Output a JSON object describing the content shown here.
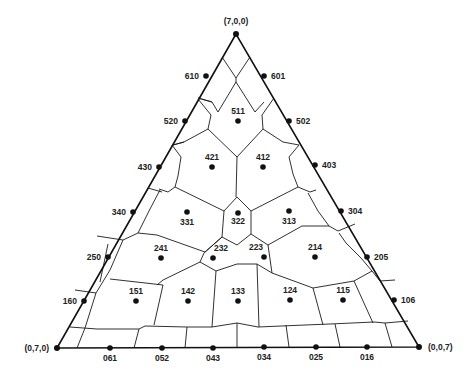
{
  "diagram": {
    "type": "ternary-voronoi",
    "corners": [
      {
        "id": "top",
        "label": "(7,0,0)",
        "x": 236,
        "y": 34,
        "lx": 236,
        "ly": 24,
        "anchor": "middle"
      },
      {
        "id": "left",
        "label": "(0,7,0)",
        "x": 57,
        "y": 348,
        "lx": 49,
        "ly": 351,
        "anchor": "end"
      },
      {
        "id": "right",
        "label": "(0,0,7)",
        "x": 419,
        "y": 347,
        "lx": 428,
        "ly": 350,
        "anchor": "start"
      }
    ],
    "points": [
      {
        "label": "610",
        "x": 206,
        "y": 76,
        "lx": 199,
        "ly": 79,
        "anchor": "end"
      },
      {
        "label": "601",
        "x": 264,
        "y": 76,
        "lx": 271,
        "ly": 79,
        "anchor": "start"
      },
      {
        "label": "520",
        "x": 185,
        "y": 121,
        "lx": 178,
        "ly": 124,
        "anchor": "end"
      },
      {
        "label": "511",
        "x": 238,
        "y": 121,
        "lx": 238,
        "ly": 114,
        "anchor": "middle"
      },
      {
        "label": "502",
        "x": 289,
        "y": 121,
        "lx": 296,
        "ly": 124,
        "anchor": "start"
      },
      {
        "label": "430",
        "x": 159,
        "y": 167,
        "lx": 152,
        "ly": 170,
        "anchor": "end"
      },
      {
        "label": "421",
        "x": 212,
        "y": 167,
        "lx": 212,
        "ly": 160,
        "anchor": "middle"
      },
      {
        "label": "412",
        "x": 263,
        "y": 167,
        "lx": 263,
        "ly": 160,
        "anchor": "middle"
      },
      {
        "label": "403",
        "x": 315,
        "y": 165,
        "lx": 322,
        "ly": 168,
        "anchor": "start"
      },
      {
        "label": "340",
        "x": 133,
        "y": 212,
        "lx": 126,
        "ly": 215,
        "anchor": "end"
      },
      {
        "label": "331",
        "x": 187,
        "y": 212,
        "lx": 187,
        "ly": 225,
        "anchor": "middle"
      },
      {
        "label": "322",
        "x": 238,
        "y": 213,
        "lx": 238,
        "ly": 224,
        "anchor": "middle"
      },
      {
        "label": "313",
        "x": 289,
        "y": 211,
        "lx": 289,
        "ly": 224,
        "anchor": "middle"
      },
      {
        "label": "304",
        "x": 341,
        "y": 211,
        "lx": 348,
        "ly": 214,
        "anchor": "start"
      },
      {
        "label": "250",
        "x": 108,
        "y": 257,
        "lx": 101,
        "ly": 260,
        "anchor": "end"
      },
      {
        "label": "241",
        "x": 161,
        "y": 258,
        "lx": 161,
        "ly": 251,
        "anchor": "middle"
      },
      {
        "label": "232",
        "x": 213,
        "y": 258,
        "lx": 221,
        "ly": 251,
        "anchor": "middle"
      },
      {
        "label": "223",
        "x": 264,
        "y": 257,
        "lx": 256,
        "ly": 250,
        "anchor": "middle"
      },
      {
        "label": "214",
        "x": 315,
        "y": 257,
        "lx": 315,
        "ly": 250,
        "anchor": "middle"
      },
      {
        "label": "205",
        "x": 367,
        "y": 257,
        "lx": 374,
        "ly": 260,
        "anchor": "start"
      },
      {
        "label": "160",
        "x": 84,
        "y": 301,
        "lx": 77,
        "ly": 304,
        "anchor": "end"
      },
      {
        "label": "151",
        "x": 136,
        "y": 301,
        "lx": 136,
        "ly": 294,
        "anchor": "middle"
      },
      {
        "label": "142",
        "x": 188,
        "y": 301,
        "lx": 188,
        "ly": 294,
        "anchor": "middle"
      },
      {
        "label": "133",
        "x": 238,
        "y": 301,
        "lx": 238,
        "ly": 294,
        "anchor": "middle"
      },
      {
        "label": "124",
        "x": 290,
        "y": 300,
        "lx": 290,
        "ly": 293,
        "anchor": "middle"
      },
      {
        "label": "115",
        "x": 343,
        "y": 300,
        "lx": 343,
        "ly": 293,
        "anchor": "middle"
      },
      {
        "label": "106",
        "x": 394,
        "y": 300,
        "lx": 401,
        "ly": 303,
        "anchor": "start"
      },
      {
        "label": "061",
        "x": 110,
        "y": 348,
        "lx": 110,
        "ly": 361,
        "anchor": "middle"
      },
      {
        "label": "052",
        "x": 162,
        "y": 348,
        "lx": 162,
        "ly": 361,
        "anchor": "middle"
      },
      {
        "label": "043",
        "x": 213,
        "y": 348,
        "lx": 213,
        "ly": 361,
        "anchor": "middle"
      },
      {
        "label": "034",
        "x": 264,
        "y": 347,
        "lx": 264,
        "ly": 360,
        "anchor": "middle"
      },
      {
        "label": "025",
        "x": 316,
        "y": 347,
        "lx": 316,
        "ly": 360,
        "anchor": "middle"
      },
      {
        "label": "016",
        "x": 367,
        "y": 347,
        "lx": 367,
        "ly": 360,
        "anchor": "middle"
      }
    ],
    "edges": [
      [
        222,
        57,
        236,
        78
      ],
      [
        250,
        57,
        236,
        78
      ],
      [
        236,
        78,
        236,
        82
      ],
      [
        236,
        82,
        218,
        112
      ],
      [
        236,
        82,
        255,
        112
      ],
      [
        218,
        112,
        212,
        102
      ],
      [
        255,
        112,
        264,
        102
      ],
      [
        198,
        98,
        212,
        102
      ],
      [
        212,
        102,
        198,
        98
      ],
      [
        198,
        99,
        211,
        115
      ],
      [
        274,
        98,
        262,
        115
      ],
      [
        211,
        115,
        208,
        129
      ],
      [
        262,
        115,
        263,
        129
      ],
      [
        208,
        129,
        237,
        157
      ],
      [
        263,
        129,
        237,
        157
      ],
      [
        237,
        157,
        236,
        197
      ],
      [
        208,
        129,
        184,
        142
      ],
      [
        184,
        142,
        173,
        145
      ],
      [
        263,
        129,
        283,
        142
      ],
      [
        283,
        142,
        299,
        145
      ],
      [
        173,
        145,
        184,
        142
      ],
      [
        172,
        145,
        181,
        157
      ],
      [
        181,
        157,
        178,
        176
      ],
      [
        299,
        145,
        289,
        157
      ],
      [
        289,
        157,
        293,
        174
      ],
      [
        178,
        176,
        175,
        187
      ],
      [
        293,
        174,
        298,
        187
      ],
      [
        175,
        187,
        224,
        211
      ],
      [
        298,
        187,
        251,
        211
      ],
      [
        224,
        211,
        237,
        197
      ],
      [
        237,
        197,
        251,
        211
      ],
      [
        224,
        211,
        222,
        237
      ],
      [
        251,
        211,
        251,
        234
      ],
      [
        222,
        237,
        237,
        245
      ],
      [
        251,
        234,
        237,
        245
      ],
      [
        175,
        187,
        168,
        192
      ],
      [
        168,
        192,
        159,
        189
      ],
      [
        298,
        187,
        310,
        192
      ],
      [
        310,
        192,
        316,
        190
      ],
      [
        148,
        188,
        162,
        192
      ],
      [
        160,
        190,
        150,
        209
      ],
      [
        150,
        209,
        138,
        233
      ],
      [
        138,
        233,
        157,
        235
      ],
      [
        157,
        235,
        205,
        252
      ],
      [
        205,
        252,
        222,
        237
      ],
      [
        222,
        237,
        204,
        253
      ],
      [
        251,
        234,
        268,
        245
      ],
      [
        268,
        245,
        302,
        226
      ],
      [
        302,
        226,
        329,
        226
      ],
      [
        329,
        226,
        318,
        211
      ],
      [
        318,
        211,
        308,
        193
      ],
      [
        329,
        226,
        338,
        231
      ],
      [
        338,
        231,
        355,
        224
      ],
      [
        204,
        253,
        200,
        262
      ],
      [
        200,
        262,
        216,
        271
      ],
      [
        216,
        271,
        237,
        264
      ],
      [
        237,
        264,
        257,
        264
      ],
      [
        257,
        264,
        272,
        273
      ],
      [
        272,
        273,
        268,
        245
      ],
      [
        216,
        271,
        212,
        327
      ],
      [
        257,
        264,
        259,
        327
      ],
      [
        200,
        262,
        163,
        280
      ],
      [
        163,
        280,
        157,
        285
      ],
      [
        138,
        233,
        123,
        240
      ],
      [
        123,
        240,
        97,
        236
      ],
      [
        108,
        244,
        100,
        282
      ],
      [
        123,
        240,
        110,
        270
      ],
      [
        110,
        270,
        96,
        293
      ],
      [
        96,
        293,
        75,
        290
      ],
      [
        110,
        279,
        163,
        285
      ],
      [
        163,
        285,
        154,
        325
      ],
      [
        272,
        273,
        313,
        288
      ],
      [
        313,
        288,
        354,
        281
      ],
      [
        354,
        281,
        372,
        271
      ],
      [
        372,
        271,
        380,
        281
      ],
      [
        372,
        271,
        361,
        258
      ],
      [
        361,
        258,
        346,
        243
      ],
      [
        346,
        243,
        339,
        233
      ],
      [
        313,
        288,
        323,
        325
      ],
      [
        354,
        281,
        373,
        323
      ],
      [
        380,
        281,
        395,
        280
      ],
      [
        96,
        293,
        85,
        328
      ],
      [
        70,
        327,
        97,
        329
      ],
      [
        97,
        329,
        139,
        329
      ],
      [
        139,
        329,
        145,
        326
      ],
      [
        145,
        326,
        187,
        327
      ],
      [
        187,
        327,
        212,
        327
      ],
      [
        212,
        327,
        237,
        323
      ],
      [
        237,
        323,
        258,
        327
      ],
      [
        258,
        327,
        305,
        325
      ],
      [
        305,
        325,
        330,
        324
      ],
      [
        330,
        324,
        374,
        322
      ],
      [
        374,
        322,
        385,
        323
      ],
      [
        385,
        323,
        408,
        321
      ],
      [
        85,
        328,
        77,
        348
      ],
      [
        139,
        329,
        134,
        348
      ],
      [
        187,
        327,
        185,
        348
      ],
      [
        237,
        323,
        237,
        347
      ],
      [
        286,
        325,
        289,
        347
      ],
      [
        335,
        324,
        340,
        347
      ],
      [
        385,
        323,
        392,
        347
      ]
    ]
  }
}
